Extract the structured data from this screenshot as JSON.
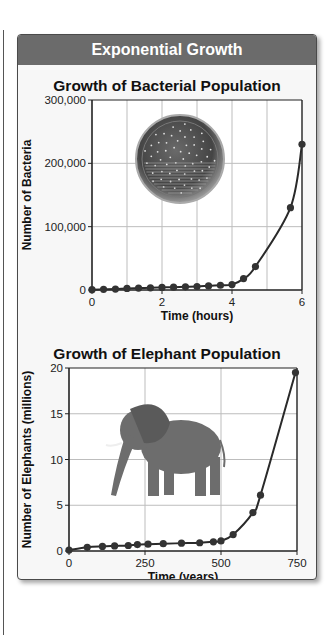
{
  "panel": {
    "header": "Exponential Growth",
    "colors": {
      "header_bg": "#6b6b6b",
      "header_text": "#ffffff",
      "panel_bg": "#f7f7f7",
      "line": "#2a2a2a",
      "grid": "#bdbdbd"
    }
  },
  "chart_data": [
    {
      "type": "line",
      "title": "Growth of Bacterial Population",
      "xlabel": "Time (hours)",
      "ylabel": "Number of Bacteria",
      "xlim": [
        0,
        6
      ],
      "ylim": [
        0,
        300000
      ],
      "x_ticks": [
        "0",
        "2",
        "4",
        "6"
      ],
      "y_ticks": [
        "0",
        "100,000",
        "200,000",
        "300,000"
      ],
      "grid": true,
      "image": "petri-dish",
      "x": [
        0,
        0.33,
        0.67,
        1,
        1.33,
        1.67,
        2,
        2.33,
        2.67,
        3,
        3.33,
        3.67,
        4,
        4.33,
        4.67,
        5.67,
        6
      ],
      "values": [
        500,
        1000,
        1500,
        2500,
        3000,
        3500,
        4000,
        4500,
        5000,
        5500,
        6500,
        7500,
        8500,
        18000,
        37000,
        130000,
        230000
      ]
    },
    {
      "type": "line",
      "title": "Growth of Elephant Population",
      "xlabel": "Time (years)",
      "ylabel": "Number of Elephants (millions)",
      "xlim": [
        0,
        750
      ],
      "ylim": [
        0,
        20
      ],
      "x_ticks": [
        "0",
        "250",
        "500",
        "750"
      ],
      "y_ticks": [
        "0",
        "5",
        "10",
        "15",
        "20"
      ],
      "grid": true,
      "image": "elephant",
      "x": [
        0,
        60,
        110,
        150,
        195,
        225,
        260,
        310,
        370,
        430,
        475,
        500,
        540,
        605,
        630,
        745
      ],
      "values": [
        0.1,
        0.4,
        0.5,
        0.55,
        0.6,
        0.7,
        0.75,
        0.8,
        0.85,
        0.9,
        1.0,
        1.1,
        1.8,
        4.2,
        6.1,
        19.5
      ]
    }
  ]
}
